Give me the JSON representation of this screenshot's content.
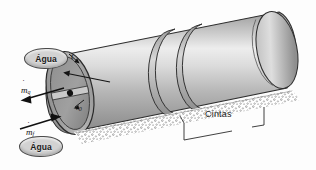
{
  "figure": {
    "type": "technical-diagram",
    "background_color": "#fdfdfd"
  },
  "labels": {
    "water_top": "Água",
    "water_bottom": "Água",
    "thickness": "t",
    "mass_flow_hot": "m",
    "mass_flow_hot_sub": "q",
    "mass_flow_cold": "m",
    "mass_flow_cold_sub": "f",
    "radius": "r",
    "radius_sub": "0",
    "bands": "Cintas"
  },
  "colors": {
    "shell_light": "#e9e9e9",
    "shell_mid": "#b8b8b8",
    "shell_dark": "#8d8d8d",
    "end_face": "#9a9a9a",
    "end_rim": "#a8a8a8",
    "outline": "#2a2a2a",
    "speckle": "#7a7a7a",
    "bubble_fill": "#d2d2d2",
    "text": "#1a1a1a"
  },
  "geometry": {
    "cylinder_axis_left_x": 68,
    "cylinder_axis_left_y": 95,
    "cylinder_axis_right_x": 284,
    "cylinder_axis_right_y": 52,
    "end_ellipse_rx": 22,
    "end_ellipse_ry": 42,
    "band_count": 2
  },
  "annotations": {
    "arrow_hot_direction": "left-down",
    "arrow_cold_direction": "right-up",
    "thickness_arrow_direction": "down-right",
    "radius_arrow_direction": "down-left",
    "cintas_bracket": "spans lower-right section of cylinder"
  }
}
